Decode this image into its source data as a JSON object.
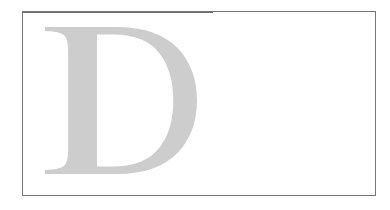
{
  "page": {
    "background_color": "#ffffff",
    "width": 390,
    "height": 210
  },
  "frame": {
    "name": "content-frame",
    "border_color": "#767676",
    "border_width_px": 1,
    "background_color": "#ffffff",
    "left_px": 22,
    "top_px": 11,
    "width_px": 354,
    "height_px": 185
  },
  "dropcap": {
    "character": "D",
    "style": "serif-capital",
    "color": "#cdcdcd",
    "alt_text": "Large light gray serif capital letter D"
  },
  "body": {
    "text": ""
  }
}
